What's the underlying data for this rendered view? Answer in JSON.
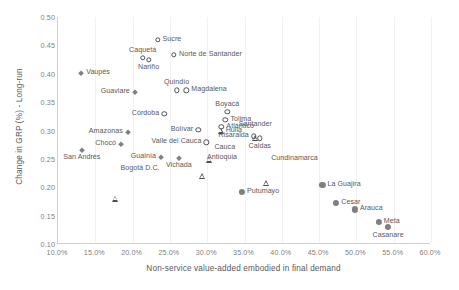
{
  "chart_data": {
    "type": "scatter",
    "title": "",
    "xlabel": "Non-service value-added embodied in final demand",
    "ylabel": "Change in GRP (%) - Long-run",
    "xlim": [
      0.1,
      0.6
    ],
    "ylim": [
      0.1,
      0.5
    ],
    "xticks": [
      "10.0%",
      "15.0%",
      "20.0%",
      "25.0%",
      "30.0%",
      "35.0%",
      "40.0%",
      "45.0%",
      "50.0%",
      "55.0%",
      "60.0%"
    ],
    "xtick_values": [
      0.1,
      0.15,
      0.2,
      0.25,
      0.3,
      0.35,
      0.4,
      0.45,
      0.5,
      0.55,
      0.6
    ],
    "yticks": [
      "0.10",
      "0.15",
      "0.20",
      "0.25",
      "0.30",
      "0.35",
      "0.40",
      "0.45",
      "0.50"
    ],
    "ytick_values": [
      0.1,
      0.15,
      0.2,
      0.25,
      0.3,
      0.35,
      0.4,
      0.45,
      0.5
    ],
    "grid": "vertical",
    "legend": "none",
    "marker_colors": {
      "open_outline": "#4f4f4f",
      "filled_gray": "#808080",
      "axis_gray": "#d0d0d0",
      "gridline": "#f2f2f2",
      "text": "#595959",
      "tick_text": "#808080"
    },
    "points": [
      {
        "name": "Sucre",
        "x": 0.2335,
        "y": 0.46,
        "marker": "circle-open",
        "label_pos": "r"
      },
      {
        "name": "Caquetá",
        "x": 0.2135,
        "y": 0.428,
        "marker": "circle-open",
        "label_pos": "t"
      },
      {
        "name": "Nariño",
        "x": 0.2215,
        "y": 0.4245,
        "marker": "circle-open",
        "label_pos": "b"
      },
      {
        "name": "Norte de Santander",
        "x": 0.2555,
        "y": 0.433,
        "marker": "circle-open",
        "label_pos": "r"
      },
      {
        "name": "Vaupés",
        "x": 0.131,
        "y": 0.401,
        "marker": "diamond-small",
        "label_pos": "r"
      },
      {
        "name": "Quindío",
        "x": 0.259,
        "y": 0.371,
        "marker": "circle-open",
        "label_pos": "t"
      },
      {
        "name": "Magdalena",
        "x": 0.272,
        "y": 0.371,
        "marker": "circle-open",
        "label_pos": "r"
      },
      {
        "name": "Guaviare",
        "x": 0.203,
        "y": 0.367,
        "marker": "diamond-small",
        "label_pos": "l"
      },
      {
        "name": "Boyacá",
        "x": 0.327,
        "y": 0.333,
        "marker": "circle-open",
        "label_pos": "t"
      },
      {
        "name": "Córdoba",
        "x": 0.2425,
        "y": 0.3295,
        "marker": "circle-open",
        "label_pos": "l"
      },
      {
        "name": "Tolima",
        "x": 0.3245,
        "y": 0.319,
        "marker": "circle-open",
        "label_pos": "r"
      },
      {
        "name": "Atlántico",
        "x": 0.319,
        "y": 0.3065,
        "marker": "circle-open",
        "label_pos": "r"
      },
      {
        "name": "Huila",
        "x": 0.318,
        "y": 0.2995,
        "marker": "triangle-open",
        "label_pos": "r"
      },
      {
        "name": "Bolívar",
        "x": 0.288,
        "y": 0.3015,
        "marker": "circle-open",
        "label_pos": "l"
      },
      {
        "name": "Amazonas",
        "x": 0.1935,
        "y": 0.298,
        "marker": "diamond-small",
        "label_pos": "l"
      },
      {
        "name": "Santander",
        "x": 0.3645,
        "y": 0.2975,
        "marker": "triangle-open",
        "label_pos": "t"
      },
      {
        "name": "Risaralda",
        "x": 0.3625,
        "y": 0.2895,
        "marker": "circle-open",
        "label_pos": "l"
      },
      {
        "name": "Caldas",
        "x": 0.3705,
        "y": 0.286,
        "marker": "circle-open",
        "label_pos": "b"
      },
      {
        "name": "Chocó",
        "x": 0.1845,
        "y": 0.276,
        "marker": "diamond-small",
        "label_pos": "l"
      },
      {
        "name": "Valle del Cauca",
        "x": 0.299,
        "y": 0.279,
        "marker": "circle-open",
        "label_pos": "l"
      },
      {
        "name": "Cauca",
        "x": 0.303,
        "y": 0.27,
        "marker": "triangle-open",
        "label_pos": "r"
      },
      {
        "name": "San Andrés",
        "x": 0.132,
        "y": 0.2665,
        "marker": "diamond-small",
        "label_pos": "b"
      },
      {
        "name": "Guainía",
        "x": 0.238,
        "y": 0.2525,
        "marker": "diamond-small",
        "label_pos": "l"
      },
      {
        "name": "Vichada",
        "x": 0.262,
        "y": 0.252,
        "marker": "diamond-small",
        "label_pos": "b"
      },
      {
        "name": "Antioquia",
        "x": 0.293,
        "y": 0.251,
        "marker": "triangle-open",
        "label_pos": "r"
      },
      {
        "name": "Cundinamarca",
        "x": 0.379,
        "y": 0.2495,
        "marker": "triangle-open",
        "label_pos": "r"
      },
      {
        "name": "Bogotá D.C.",
        "x": 0.177,
        "y": 0.233,
        "marker": "triangle-open",
        "label_pos": "r"
      },
      {
        "name": "La Guajira",
        "x": 0.4545,
        "y": 0.2035,
        "marker": "circle-filled",
        "label_pos": "r"
      },
      {
        "name": "Putumayo",
        "x": 0.3465,
        "y": 0.1915,
        "marker": "circle-filled",
        "label_pos": "r"
      },
      {
        "name": "Cesar",
        "x": 0.473,
        "y": 0.172,
        "marker": "circle-filled",
        "label_pos": "r"
      },
      {
        "name": "Arauca",
        "x": 0.498,
        "y": 0.161,
        "marker": "circle-filled",
        "label_pos": "r"
      },
      {
        "name": "Meta",
        "x": 0.53,
        "y": 0.1395,
        "marker": "circle-filled",
        "label_pos": "r"
      },
      {
        "name": "Casanare",
        "x": 0.5425,
        "y": 0.1295,
        "marker": "circle-filled",
        "label_pos": "b"
      }
    ]
  }
}
